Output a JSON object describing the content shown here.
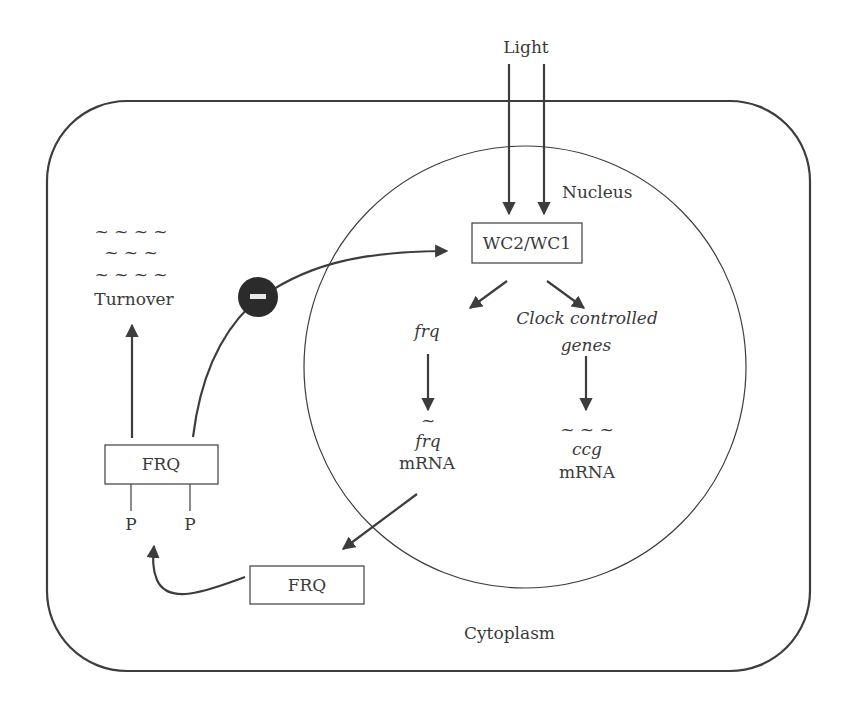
{
  "diagram": {
    "compartments": {
      "cell_label": "Cytoplasm",
      "nucleus_label": "Nucleus"
    },
    "input": {
      "label": "Light"
    },
    "nodes": {
      "wc_complex": "WC2/WC1",
      "frq_gene": "frq",
      "ccg_genes_line1": "Clock controlled",
      "ccg_genes_line2": "genes",
      "frq_mrna_tilde": "~",
      "frq_mrna_italic": "frq",
      "frq_mrna_label": "mRNA",
      "ccg_mrna_tilde": "~ ~ ~",
      "ccg_mrna_italic": "ccg",
      "ccg_mrna_label": "mRNA",
      "frq_protein": "FRQ",
      "frq_phosphorylated": "FRQ",
      "phospho_left": "P",
      "phospho_right": "P",
      "turnover_label": "Turnover",
      "turnover_tilde_1": "~ ~ ~ ~",
      "turnover_tilde_2": "~ ~ ~",
      "turnover_tilde_3": "~ ~ ~ ~",
      "inhibition_symbol": "–"
    },
    "edges": [
      {
        "from": "Light",
        "to": "WC2/WC1",
        "type": "activation",
        "count": 2
      },
      {
        "from": "WC2/WC1",
        "to": "frq",
        "type": "activation"
      },
      {
        "from": "WC2/WC1",
        "to": "Clock controlled genes",
        "type": "activation"
      },
      {
        "from": "frq",
        "to": "frq mRNA",
        "type": "transcription"
      },
      {
        "from": "Clock controlled genes",
        "to": "ccg mRNA",
        "type": "transcription"
      },
      {
        "from": "frq mRNA",
        "to": "FRQ",
        "type": "translation"
      },
      {
        "from": "FRQ",
        "to": "FRQ-P",
        "type": "phosphorylation"
      },
      {
        "from": "FRQ-P",
        "to": "Turnover",
        "type": "degradation"
      },
      {
        "from": "FRQ-P",
        "to": "WC2/WC1",
        "type": "inhibition"
      }
    ],
    "colors": {
      "stroke": "#3d3d3d",
      "inhibitor_fill": "#2b2b2b",
      "background": "#ffffff"
    }
  }
}
